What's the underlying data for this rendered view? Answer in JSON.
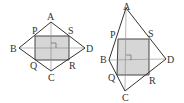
{
  "figures": [
    {
      "id": "left",
      "description": "Rhombus-like quadrilateral ABCD with inscribed rectangle PQRS (midpoints), diagonals AC and BD perpendicular",
      "labels": {
        "A": "A",
        "B": "B",
        "C": "C",
        "D": "D",
        "P": "P",
        "Q": "Q",
        "R": "R",
        "S": "S"
      },
      "right_angle_mark": true
    },
    {
      "id": "right",
      "description": "Kite-like quadrilateral ABCD with inscribed square PQRS (midpoints), diagonals AC and BD perpendicular",
      "labels": {
        "A": "A",
        "B": "B",
        "C": "C",
        "D": "D",
        "P": "P",
        "Q": "Q",
        "R": "R",
        "S": "S"
      },
      "right_angle_mark": true
    }
  ],
  "colors": {
    "outline": "#333333",
    "diagonal": "#777777",
    "fill": "#d6d6d6"
  }
}
